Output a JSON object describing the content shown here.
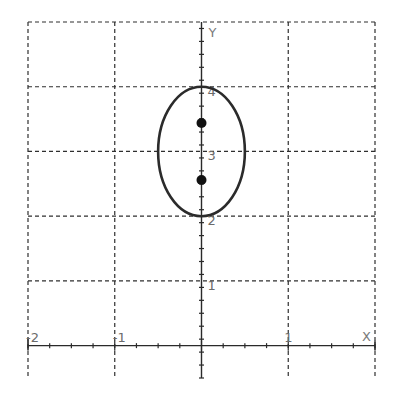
{
  "chart_data": {
    "type": "scatter",
    "title": "",
    "xlabel": "X",
    "ylabel": "Y",
    "xlim": [
      -2,
      2
    ],
    "ylim": [
      -0.5,
      5
    ],
    "grid": true,
    "grid_style": "dashed",
    "x_major_ticks": [
      -2,
      -1,
      0,
      1,
      2
    ],
    "x_minor_step": 0.25,
    "y_major_ticks": [
      0,
      1,
      2,
      3,
      4,
      5
    ],
    "y_minor_step": 0.2,
    "x_tick_labels": [
      {
        "value": -2,
        "text": "-2"
      },
      {
        "value": -1,
        "text": "-1"
      },
      {
        "value": 1,
        "text": "1"
      }
    ],
    "y_tick_labels": [
      {
        "value": 1,
        "text": "1"
      },
      {
        "value": 2,
        "text": "2"
      },
      {
        "value": 3,
        "text": "3"
      },
      {
        "value": 4,
        "text": "4"
      }
    ],
    "shapes": [
      {
        "type": "ellipse",
        "center": [
          0,
          3
        ],
        "rx": 0.5,
        "ry": 1,
        "color": "#2b2b2b"
      }
    ],
    "series": [
      {
        "name": "foci",
        "x": [
          0,
          0
        ],
        "y": [
          3.44,
          2.56
        ],
        "color": "#111111",
        "marker": "filled-circle"
      }
    ]
  },
  "axes": {
    "x_name": "X",
    "y_name": "Y"
  },
  "colors": {
    "grid": "#2f2f2f",
    "axis": "#2a2a2a",
    "label": "#6b6b6b",
    "background": "#ffffff"
  }
}
